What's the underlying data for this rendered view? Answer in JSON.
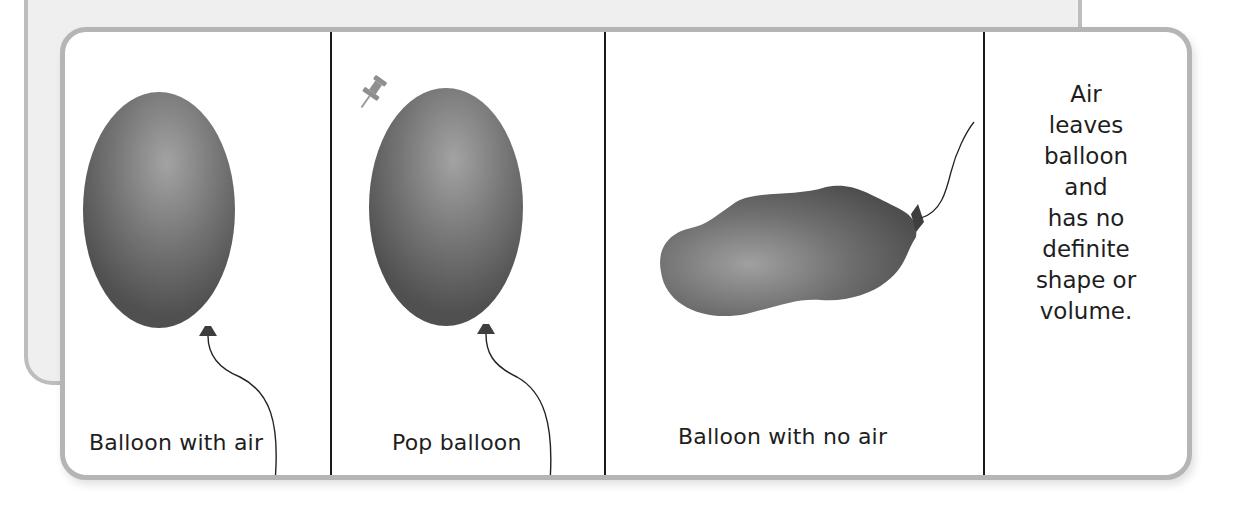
{
  "diagram": {
    "topic": "Gas has no definite shape or volume (balloon example)",
    "panels": [
      {
        "id": "balloon-with-air",
        "caption": "Balloon with air",
        "illustration": "inflated-balloon-with-string"
      },
      {
        "id": "pop-balloon",
        "caption": "Pop balloon",
        "illustration": "inflated-balloon-with-pushpin"
      },
      {
        "id": "balloon-with-no-air",
        "caption": "Balloon with no air",
        "illustration": "deflated-balloon"
      },
      {
        "id": "explanation",
        "lines": [
          "Air",
          "leaves",
          "balloon",
          "and",
          "has no",
          "definite",
          "shape or",
          "volume."
        ]
      }
    ],
    "colors": {
      "balloon_dark": "#5a5a5a",
      "balloon_light": "#9a9a9a",
      "border": "#b5b5b5",
      "backdrop": "#efefef",
      "divider": "#1a1a1a",
      "text": "#1e1e1e"
    }
  }
}
